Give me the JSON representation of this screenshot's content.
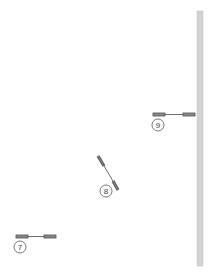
{
  "diagram": {
    "colors": {
      "background": "#ffffff",
      "rail": "#d2d2d2",
      "rail_edge": "#c4c4c4",
      "component_dark": "#505050",
      "component_fill": "#8a8a8a",
      "wire": "#4a4a4a",
      "callout_stroke": "#555555"
    },
    "rail": {
      "label": "vertical rail",
      "x": 197,
      "y": 11,
      "width": 6,
      "height": 255
    },
    "components": [
      {
        "id": "7",
        "label": "7",
        "orientation": "horizontal",
        "left_bar": [
          16,
          235,
          12,
          3
        ],
        "wire": [
          28,
          236.5,
          44,
          236.5
        ],
        "right_bar": [
          44,
          235,
          12,
          3
        ],
        "callout": [
          20,
          247,
          6
        ]
      },
      {
        "id": "8",
        "label": "8",
        "orientation": "diagonal",
        "upper_bar": [
          98,
          156,
          104,
          166
        ],
        "wire": [
          104,
          166,
          113,
          181
        ],
        "lower_bar": [
          113,
          181,
          118,
          190
        ],
        "callout": [
          106,
          191,
          6
        ]
      },
      {
        "id": "9",
        "label": "9",
        "orientation": "horizontal",
        "left_bar": [
          153,
          113,
          12,
          3
        ],
        "wire": [
          165,
          114.5,
          183,
          114.5
        ],
        "right_bar": [
          183,
          113,
          12,
          3
        ],
        "callout": [
          158,
          125,
          6
        ]
      }
    ]
  }
}
